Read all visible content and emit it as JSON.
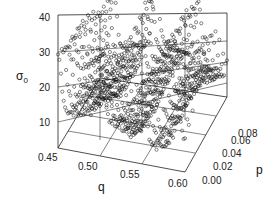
{
  "chart_data": {
    "type": "scatter",
    "subtype": "3d-scatter",
    "title": "",
    "xlabel": "q",
    "ylabel": "p",
    "zlabel": "σ0",
    "zlabel_main": "σ",
    "zlabel_sub": "0",
    "xlim": [
      0.45,
      0.6
    ],
    "ylim": [
      0.0,
      0.08
    ],
    "zlim": [
      5,
      40
    ],
    "x_ticks": [
      "0.45",
      "0.50",
      "0.55",
      "0.60"
    ],
    "y_ticks": [
      "0.00",
      "0.02",
      "0.04",
      "0.06",
      "0.08"
    ],
    "z_ticks": [
      "10",
      "20",
      "30",
      "40"
    ],
    "grid": true,
    "marker": "open circle",
    "series": [
      {
        "name": "p=0.00 slice",
        "p": 0.0,
        "q": [
          0.45,
          0.455,
          0.46,
          0.47,
          0.48,
          0.49,
          0.5,
          0.51,
          0.52,
          0.53,
          0.54,
          0.545,
          0.55,
          0.555,
          0.56,
          0.57,
          0.58,
          0.59,
          0.6
        ],
        "sigma0": [
          40,
          33,
          26,
          20,
          18,
          17,
          17.5,
          19,
          17,
          16,
          16.5,
          17,
          38,
          14,
          16,
          20,
          28,
          35,
          40
        ]
      },
      {
        "name": "peaks along p",
        "p": [
          0.0,
          0.02,
          0.04,
          0.06,
          0.08
        ],
        "peak_q": [
          0.45,
          0.5,
          0.55,
          0.59,
          0.6
        ],
        "peak_sigma0": [
          40,
          38,
          38,
          38,
          28
        ]
      }
    ]
  }
}
